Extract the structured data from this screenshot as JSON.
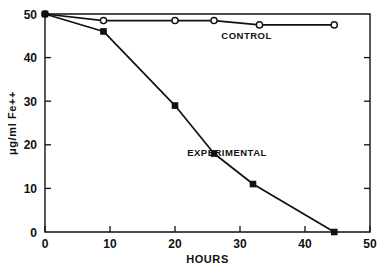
{
  "chart_data": {
    "type": "line",
    "title": "",
    "subtitle": "",
    "xlabel": "HOURS",
    "ylabel": "μg/ml Fe++",
    "xlim": [
      0,
      50
    ],
    "ylim": [
      0,
      50
    ],
    "xticks": [
      0,
      10,
      20,
      30,
      40,
      50
    ],
    "xticklabels": [
      "0",
      "10",
      "20",
      "30",
      "40",
      "50"
    ],
    "yticks": [
      0,
      10,
      20,
      30,
      40,
      50
    ],
    "yticklabels": [
      "0",
      "10",
      "20",
      "30",
      "40",
      "50"
    ],
    "grid": false,
    "legend_position": "inline-annotation",
    "series": [
      {
        "name": "CONTROL",
        "marker": "open-circle",
        "annotation": "CONTROL",
        "annotation_x": 31,
        "annotation_y": 44.2,
        "x": [
          0,
          9,
          20,
          26,
          33,
          44.5
        ],
        "y": [
          50,
          48.5,
          48.5,
          48.5,
          47.5,
          47.5
        ]
      },
      {
        "name": "EXPERIMENTAL",
        "marker": "filled-square",
        "annotation": "EXPERIMENTAL",
        "annotation_x": 28,
        "annotation_y": 17.5,
        "x": [
          0,
          9,
          20,
          26,
          32,
          44.5
        ],
        "y": [
          50,
          46,
          29,
          18,
          11,
          0
        ]
      }
    ],
    "colors": {
      "axis": "#111111",
      "control_line": "#111111",
      "experimental_line": "#111111",
      "background": "#ffffff"
    }
  }
}
